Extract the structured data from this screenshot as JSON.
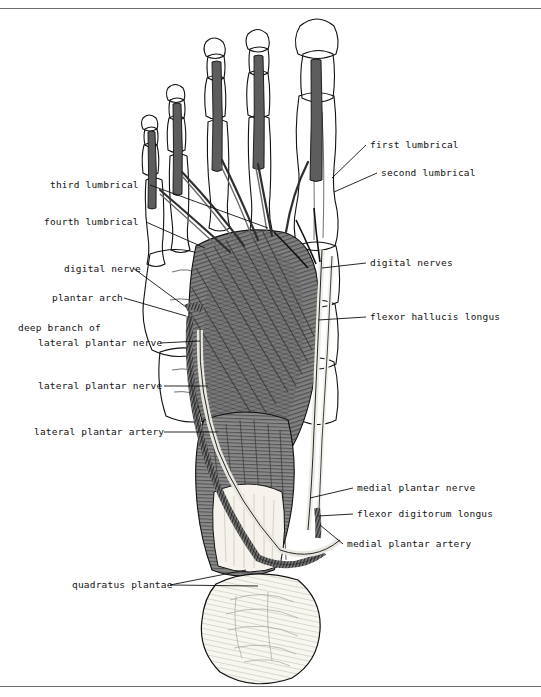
{
  "figure": {
    "view": "plantar",
    "palette": {
      "ink": "#111111",
      "bone_fill": "#f7f5ef",
      "bone_shadow": "#cfcabb",
      "muscle_fill": "#808080",
      "muscle_dark": "#4a4a4a",
      "muscle_light": "#a8a8a8",
      "tendon_fill": "#f2f0ea",
      "nerve_fill": "#9a9a9a",
      "artery_fill": "#707070",
      "background": "#ffffff",
      "border": "#6e6e6e"
    }
  },
  "labels": {
    "left": [
      {
        "id": "third-lumbrical",
        "text": "third lumbrical",
        "x": 50,
        "y": 188
      },
      {
        "id": "fourth-lumbrical",
        "text": "fourth lumbrical",
        "x": 44,
        "y": 225
      },
      {
        "id": "digital-nerve",
        "text": "digital nerve",
        "x": 64,
        "y": 272
      },
      {
        "id": "plantar-arch",
        "text": "plantar arch",
        "x": 52,
        "y": 301
      },
      {
        "id": "deep-branch-of",
        "text": "deep branch of",
        "x": 18,
        "y": 331
      },
      {
        "id": "lateral-plantar-nerve-deep",
        "text": "lateral plantar nerve",
        "x": 38,
        "y": 346
      },
      {
        "id": "lateral-plantar-nerve",
        "text": "lateral plantar nerve",
        "x": 38,
        "y": 389
      },
      {
        "id": "lateral-plantar-artery",
        "text": "lateral plantar artery",
        "x": 34,
        "y": 435
      },
      {
        "id": "quadratus-plantae",
        "text": "quadratus plantae",
        "x": 72,
        "y": 588
      }
    ],
    "right": [
      {
        "id": "first-lumbrical",
        "text": "first lumbrical",
        "x": 370,
        "y": 148
      },
      {
        "id": "second-lumbrical",
        "text": "second lumbrical",
        "x": 381,
        "y": 176
      },
      {
        "id": "digital-nerves",
        "text": "digital nerves",
        "x": 370,
        "y": 266
      },
      {
        "id": "flexor-hallucis-longus",
        "text": "flexor hallucis longus",
        "x": 370,
        "y": 320
      },
      {
        "id": "medial-plantar-nerve",
        "text": "medial plantar nerve",
        "x": 357,
        "y": 491
      },
      {
        "id": "flexor-digitorum-longus",
        "text": "flexor digitorum longus",
        "x": 357,
        "y": 517
      },
      {
        "id": "medial-plantar-artery",
        "text": "medial plantar artery",
        "x": 347,
        "y": 547
      }
    ]
  },
  "leaders": [
    {
      "id": "leader-third-lumbrical",
      "d": "M150,185 L268,228"
    },
    {
      "id": "leader-fourth-lumbrical",
      "d": "M146,222 L205,248"
    },
    {
      "id": "leader-digital-nerve",
      "d": "M133,268 L186,307"
    },
    {
      "id": "leader-plantar-arch",
      "d": "M124,298 L186,316"
    },
    {
      "id": "leader-deep-branch",
      "d": "M160,343 L200,341"
    },
    {
      "id": "leader-lateral-nerve",
      "d": "M164,386 L208,386"
    },
    {
      "id": "leader-lateral-artery",
      "d": "M164,432 L218,432"
    },
    {
      "id": "leader-quadratus-a",
      "d": "M170,585 L246,570"
    },
    {
      "id": "leader-quadratus-b",
      "d": "M170,585 L258,586"
    },
    {
      "id": "leader-first-lumbrical",
      "d": "M366,145 L332,178"
    },
    {
      "id": "leader-second-lumbrical",
      "d": "M377,173 L334,192"
    },
    {
      "id": "leader-digital-nerves",
      "d": "M366,263 L322,268"
    },
    {
      "id": "leader-fhl",
      "d": "M366,317 L318,320"
    },
    {
      "id": "leader-medial-nerve",
      "d": "M353,488 L310,498"
    },
    {
      "id": "leader-fdl",
      "d": "M353,514 L318,516"
    },
    {
      "id": "leader-medial-artery",
      "d": "M343,544 L320,525"
    }
  ],
  "structures": [
    {
      "id": "phalanges",
      "name": "toe phalanges",
      "kind": "bone"
    },
    {
      "id": "metatarsals",
      "name": "metatarsal bones",
      "kind": "bone"
    },
    {
      "id": "calcaneus",
      "name": "calcaneus (heel bone)",
      "kind": "bone"
    },
    {
      "id": "lumbricals",
      "name": "lumbrical muscles",
      "kind": "muscle"
    },
    {
      "id": "quadratus-plantae",
      "name": "quadratus plantae",
      "kind": "muscle"
    },
    {
      "id": "flexor-digitorum-longus",
      "name": "flexor digitorum longus tendon",
      "kind": "tendon"
    },
    {
      "id": "flexor-hallucis-longus",
      "name": "flexor hallucis longus tendon",
      "kind": "tendon"
    },
    {
      "id": "plantar-arch",
      "name": "plantar arterial arch",
      "kind": "artery"
    },
    {
      "id": "lateral-plantar-artery",
      "name": "lateral plantar artery",
      "kind": "artery"
    },
    {
      "id": "medial-plantar-artery",
      "name": "medial plantar artery",
      "kind": "artery"
    },
    {
      "id": "lateral-plantar-nerve",
      "name": "lateral plantar nerve",
      "kind": "nerve"
    },
    {
      "id": "medial-plantar-nerve",
      "name": "medial plantar nerve",
      "kind": "nerve"
    },
    {
      "id": "digital-nerves",
      "name": "common digital nerves",
      "kind": "nerve"
    }
  ]
}
